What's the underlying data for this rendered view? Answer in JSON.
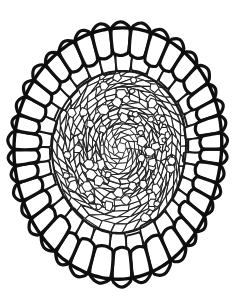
{
  "figure": {
    "title": "Cross-section cellular line drawing",
    "kind": "scientific-line-drawing",
    "caption": "",
    "background_color": "#ffffff",
    "ink_color": "#111111",
    "canvas": {
      "width": 244,
      "height": 296
    },
    "has_text_labels": false,
    "has_scale_bar": false,
    "has_axes": false
  },
  "structure": {
    "outline": {
      "name": "outer-boundary",
      "shape": "ovoid",
      "bbox": {
        "x": 17,
        "y": 20,
        "width": 208,
        "height": 258
      },
      "center": {
        "x": 121,
        "y": 149
      },
      "stroke_width_px": 3.4,
      "stroke_color": "#0d0d0d"
    },
    "layers": [
      {
        "name": "outer-cell-ring",
        "description": "single ring of large thick-walled rounded cells forming the rim",
        "cell_count": 38,
        "stroke_width_px": 3.2,
        "fill": "#ffffff"
      },
      {
        "name": "second-cell-ring",
        "description": "ring of medium elongated cells inside the rim",
        "cell_count": 34,
        "stroke_width_px": 1.9,
        "fill": "#ffffff"
      },
      {
        "name": "inner-parenchyma",
        "description": "dense field of small polygonal cells arranged in radiating files",
        "cell_count": 420,
        "stroke_width_px": 1.05,
        "fill": "#ffffff"
      },
      {
        "name": "core-region",
        "description": "finest cells converging toward an off-centre focal point",
        "focal_point": {
          "x": 126,
          "y": 141
        },
        "stroke_width_px": 0.9,
        "fill": "#ffffff"
      }
    ],
    "radial_files": 40,
    "concentric_rings": 13
  },
  "colors": {
    "background": "#ffffff",
    "outer_wall": "#0d0d0d",
    "mid_wall": "#181818",
    "inner_wall": "#222222",
    "core_wall": "#262626"
  }
}
